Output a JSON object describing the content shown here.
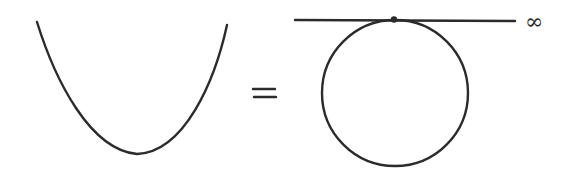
{
  "diagram": {
    "elements": {
      "parabola": {
        "label": "parabola",
        "vertex": [
          137,
          155
        ],
        "left_end": [
          37,
          22
        ],
        "right_end": [
          227,
          25
        ]
      },
      "equals_sign": {
        "label": "="
      },
      "tangent_line": {
        "label": "line-at-infinity",
        "from": [
          295,
          20
        ],
        "to": [
          515,
          20
        ]
      },
      "circle": {
        "label": "circle",
        "center": [
          395,
          93
        ],
        "radius": 73
      },
      "tangent_point": {
        "label": "point-at-infinity",
        "position": [
          394,
          19
        ]
      },
      "infinity_label": {
        "text": "∞"
      }
    },
    "colors": {
      "ink": "#2b2b2b",
      "background": "#ffffff"
    }
  }
}
